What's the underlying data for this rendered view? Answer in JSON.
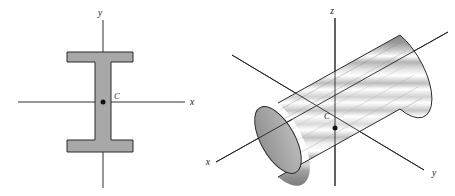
{
  "figure": {
    "background_color": "#ffffff",
    "line_color": "#1a1a1a",
    "fill_gray": "#a8a8a8",
    "fill_gray_dark": "#8f8f8f",
    "fill_gray_light": "#d5d5d5"
  },
  "panels": [
    {
      "id": "i-beam-cross-section",
      "name": "I-beam cross section with centroidal axes",
      "type": "2d-cross-section",
      "shape": "I-beam",
      "centroid": {
        "label": "C",
        "x": 103,
        "y": 102
      },
      "axes": [
        {
          "name": "y-axis",
          "label": "y",
          "orientation": "vertical",
          "label_x": 100,
          "label_y": 16,
          "x1": 103,
          "y1": 20,
          "x2": 103,
          "y2": 188
        },
        {
          "name": "x-axis",
          "label": "x",
          "orientation": "horizontal",
          "label_x": 190,
          "label_y": 105,
          "x1": 18,
          "y1": 102,
          "x2": 185,
          "y2": 102
        }
      ],
      "geometry": {
        "flange_left": 67,
        "flange_right": 133,
        "top_flange_top": 52,
        "top_flange_bottom": 62,
        "bottom_flange_top": 140,
        "bottom_flange_bottom": 152,
        "web_left": 95,
        "web_right": 111
      }
    },
    {
      "id": "circular-cylinder",
      "name": "Circular cylinder with centroidal axes",
      "type": "3d-solid",
      "shape": "cylinder",
      "centroid": {
        "label": "C",
        "x": 335,
        "y": 128
      },
      "axes": [
        {
          "name": "z-axis",
          "label": "z",
          "orientation": "vertical",
          "label_x": 332,
          "label_y": 14,
          "x1": 335,
          "y1": 18,
          "x2": 335,
          "y2": 186
        },
        {
          "name": "y-axis",
          "label": "y",
          "orientation": "oblique-down-right",
          "label_x": 432,
          "label_y": 176,
          "x1": 232,
          "y1": 55,
          "x2": 424,
          "y2": 170
        },
        {
          "name": "x-axis",
          "label": "x",
          "orientation": "oblique-up-right",
          "label_x": 210,
          "label_y": 165,
          "x1": 216,
          "y1": 162,
          "x2": 448,
          "y2": 32
        }
      ],
      "geometry": {
        "near_cap_center_x": 278,
        "near_cap_center_y": 140,
        "far_cap_center_x": 400,
        "far_cap_center_y": 72,
        "cap_rx": 17,
        "cap_ry": 37,
        "axis_tilt_degrees": -29,
        "stripe_count": 14
      }
    }
  ]
}
